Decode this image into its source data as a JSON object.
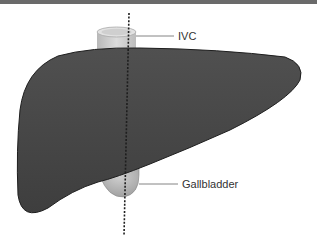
{
  "diagram": {
    "title": "",
    "labels": {
      "ivc": "IVC",
      "gallbladder": "Gallbladder"
    },
    "colors": {
      "liver": "#4a4a4a",
      "liver_outline": "#222222",
      "ivc": "#c8c8c8",
      "gallbladder": "#b0b0b0",
      "dashed_line": "#222222",
      "leader_line": "#555555",
      "top_bar": "#6a6a6a"
    }
  }
}
